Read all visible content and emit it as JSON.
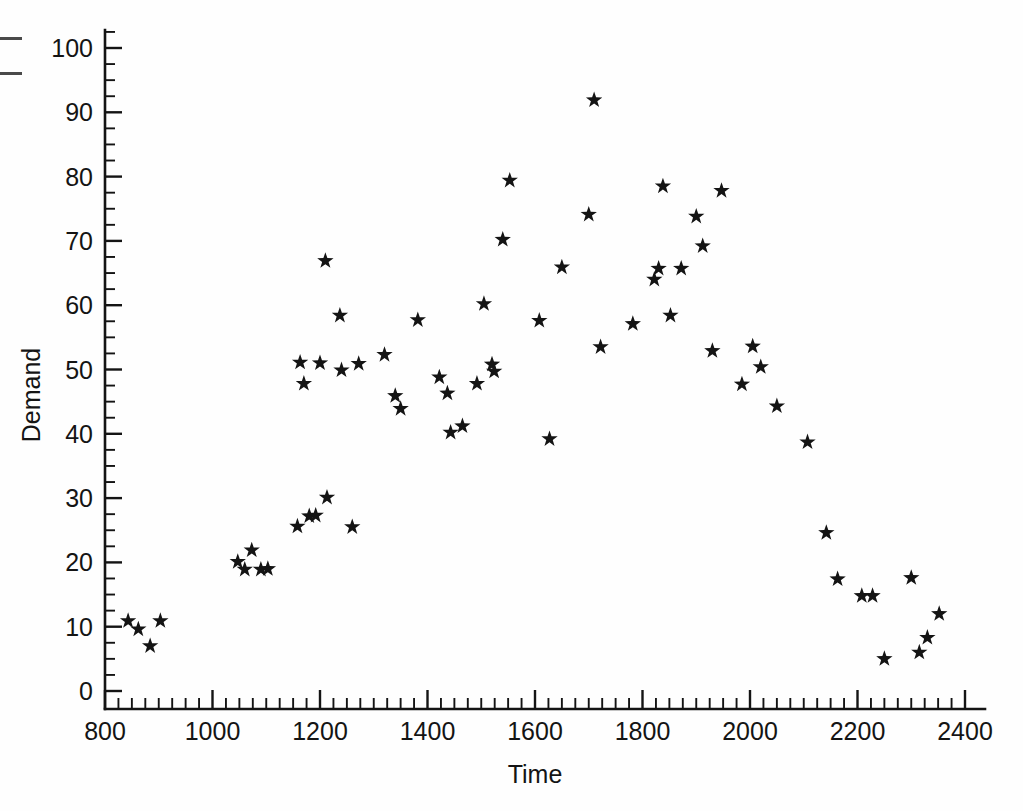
{
  "figure": {
    "background_color": "#fefefe",
    "ink_color": "#141414",
    "marker_symbol": "star",
    "artifacts": [
      {
        "name": "edge-dash-1"
      },
      {
        "name": "edge-dash-2"
      }
    ]
  },
  "chart_data": {
    "type": "scatter",
    "title": "",
    "xlabel": "Time",
    "ylabel": "Demand",
    "xlim": [
      775,
      2420
    ],
    "ylim": [
      0,
      103
    ],
    "grid": false,
    "legend": null,
    "x_ticks_major": [
      800,
      1000,
      1200,
      1400,
      1600,
      1800,
      2000,
      2200,
      2400
    ],
    "x_tick_labels": [
      "800",
      "1000",
      "1200",
      "1400",
      "1600",
      "1800",
      "2000",
      "2200",
      "2400"
    ],
    "x_minor_step": 25,
    "y_ticks_major": [
      0,
      10,
      20,
      30,
      40,
      50,
      60,
      70,
      80,
      90,
      100
    ],
    "y_tick_labels": [
      "0",
      "10",
      "20",
      "30",
      "40",
      "50",
      "60",
      "70",
      "80",
      "90",
      "100"
    ],
    "y_minor_step": 2.5,
    "marker": "star",
    "series": [
      {
        "name": "Demand",
        "points": [
          [
            843,
            10.9
          ],
          [
            862,
            9.6
          ],
          [
            884,
            7.0
          ],
          [
            903,
            10.9
          ],
          [
            1047,
            20.1
          ],
          [
            1060,
            18.9
          ],
          [
            1073,
            21.9
          ],
          [
            1090,
            18.9
          ],
          [
            1103,
            19.0
          ],
          [
            1158,
            25.6
          ],
          [
            1180,
            27.2
          ],
          [
            1192,
            27.3
          ],
          [
            1213,
            30.1
          ],
          [
            1260,
            25.5
          ],
          [
            1163,
            51.1
          ],
          [
            1170,
            47.8
          ],
          [
            1200,
            51.0
          ],
          [
            1240,
            49.9
          ],
          [
            1210,
            66.9
          ],
          [
            1237,
            58.4
          ],
          [
            1272,
            50.9
          ],
          [
            1320,
            52.3
          ],
          [
            1340,
            45.9
          ],
          [
            1350,
            43.9
          ],
          [
            1382,
            57.7
          ],
          [
            1422,
            48.8
          ],
          [
            1437,
            46.3
          ],
          [
            1443,
            40.2
          ],
          [
            1465,
            41.2
          ],
          [
            1492,
            47.8
          ],
          [
            1505,
            60.2
          ],
          [
            1520,
            50.8
          ],
          [
            1524,
            49.7
          ],
          [
            1540,
            70.2
          ],
          [
            1553,
            79.4
          ],
          [
            1608,
            57.6
          ],
          [
            1627,
            39.2
          ],
          [
            1650,
            65.9
          ],
          [
            1700,
            74.1
          ],
          [
            1710,
            91.9
          ],
          [
            1722,
            53.5
          ],
          [
            1782,
            57.1
          ],
          [
            1822,
            64.0
          ],
          [
            1830,
            65.7
          ],
          [
            1838,
            78.5
          ],
          [
            1852,
            58.4
          ],
          [
            1872,
            65.7
          ],
          [
            1900,
            73.8
          ],
          [
            1912,
            69.2
          ],
          [
            1930,
            52.9
          ],
          [
            1947,
            77.8
          ],
          [
            1985,
            47.7
          ],
          [
            2005,
            53.6
          ],
          [
            2020,
            50.4
          ],
          [
            2050,
            44.3
          ],
          [
            2107,
            38.7
          ],
          [
            2142,
            24.6
          ],
          [
            2163,
            17.4
          ],
          [
            2208,
            14.8
          ],
          [
            2228,
            14.8
          ],
          [
            2250,
            5.0
          ],
          [
            2300,
            17.6
          ],
          [
            2315,
            6.0
          ],
          [
            2330,
            8.3
          ],
          [
            2352,
            12.0
          ]
        ]
      }
    ]
  }
}
